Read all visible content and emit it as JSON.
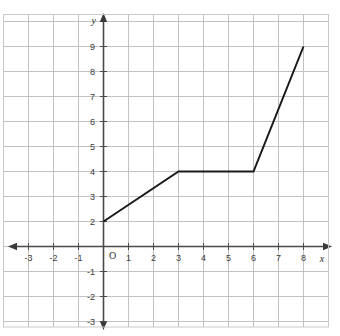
{
  "chart_data": {
    "type": "line",
    "title": "",
    "xlabel": "x",
    "ylabel": "y",
    "origin_label": "O",
    "grid": true,
    "legend": "none",
    "xlim": [
      -4,
      10
    ],
    "ylim": [
      -4,
      10
    ],
    "xticks": [
      -3,
      -2,
      -1,
      1,
      2,
      3,
      4,
      5,
      6,
      7,
      8,
      9
    ],
    "yticks": [
      -3,
      -2,
      -1,
      1,
      2,
      3,
      4,
      5,
      6,
      7,
      8,
      9
    ],
    "xtick_labels": [
      "-3",
      "-2",
      "-1",
      "1",
      "2",
      "3",
      "4",
      "5",
      "6",
      "7",
      "8",
      "9"
    ],
    "ytick_labels": [
      "-3",
      "-2",
      "-1",
      "1",
      "2",
      "3",
      "4",
      "5",
      "6",
      "7",
      "8",
      "9"
    ],
    "series": [
      {
        "name": "piecewise-line",
        "color": "#1a1a1a",
        "points": [
          {
            "x": 0,
            "y": 1
          },
          {
            "x": 3,
            "y": 3
          },
          {
            "x": 6,
            "y": 3
          },
          {
            "x": 8,
            "y": 8
          }
        ]
      }
    ],
    "segments": [
      {
        "from": [
          0,
          1
        ],
        "to": [
          3,
          3
        ],
        "slope": 0.667
      },
      {
        "from": [
          3,
          3
        ],
        "to": [
          6,
          3
        ],
        "slope": 0
      },
      {
        "from": [
          6,
          3
        ],
        "to": [
          8,
          8
        ],
        "slope": 2.5
      }
    ]
  },
  "style": {
    "grid_color": "#b9b9b9",
    "grid_color_light": "#d8d8d8",
    "axis_color": "#4a4a4a",
    "plot_color": "#1a1a1a",
    "background": "#ffffff",
    "border_color": "#c9c9c9"
  }
}
